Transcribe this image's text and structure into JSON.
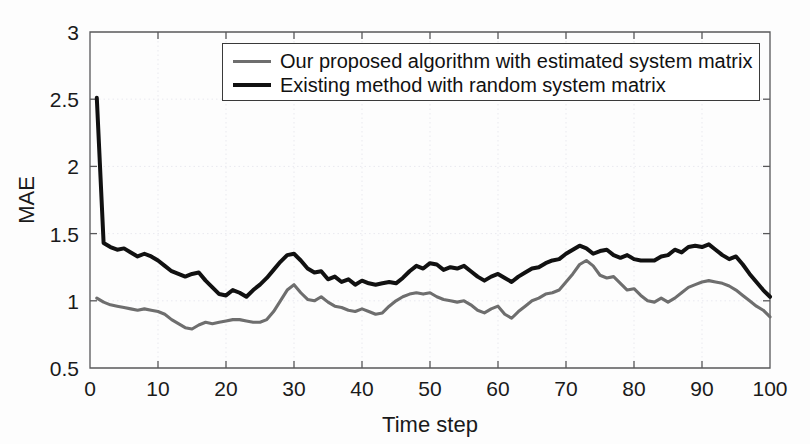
{
  "chart_data": {
    "type": "line",
    "title": "",
    "xlabel": "Time step",
    "ylabel": "MAE",
    "xlim": [
      0,
      100
    ],
    "ylim": [
      0.5,
      3
    ],
    "xticks": [
      0,
      10,
      20,
      30,
      40,
      50,
      60,
      70,
      80,
      90,
      100
    ],
    "xtick_labels": [
      "0",
      "10",
      "20",
      "30",
      "40",
      "50",
      "60",
      "70",
      "80",
      "90",
      "100"
    ],
    "yticks": [
      0.5,
      1,
      1.5,
      2,
      2.5,
      3
    ],
    "ytick_labels": [
      "0.5",
      "1",
      "1.5",
      "2",
      "2.5",
      "3"
    ],
    "grid": true,
    "legend_position": "top-center",
    "colors": {
      "proposed": "#6e6e6e",
      "existing": "#111111",
      "axis": "#58585a",
      "grid": "#e9e9ef",
      "background": "#ffffff"
    },
    "x": [
      1,
      2,
      3,
      4,
      5,
      6,
      7,
      8,
      9,
      10,
      11,
      12,
      13,
      14,
      15,
      16,
      17,
      18,
      19,
      20,
      21,
      22,
      23,
      24,
      25,
      26,
      27,
      28,
      29,
      30,
      31,
      32,
      33,
      34,
      35,
      36,
      37,
      38,
      39,
      40,
      41,
      42,
      43,
      44,
      45,
      46,
      47,
      48,
      49,
      50,
      51,
      52,
      53,
      54,
      55,
      56,
      57,
      58,
      59,
      60,
      61,
      62,
      63,
      64,
      65,
      66,
      67,
      68,
      69,
      70,
      71,
      72,
      73,
      74,
      75,
      76,
      77,
      78,
      79,
      80,
      81,
      82,
      83,
      84,
      85,
      86,
      87,
      88,
      89,
      90,
      91,
      92,
      93,
      94,
      95,
      96,
      97,
      98,
      99,
      100
    ],
    "series": [
      {
        "name": "Our proposed algorithm with estimated system matrix",
        "key": "proposed",
        "color": "#6e6e6e",
        "linewidth": 3.1,
        "values": [
          1.02,
          0.99,
          0.97,
          0.96,
          0.95,
          0.94,
          0.93,
          0.94,
          0.93,
          0.92,
          0.9,
          0.86,
          0.83,
          0.8,
          0.79,
          0.82,
          0.84,
          0.83,
          0.84,
          0.85,
          0.86,
          0.86,
          0.85,
          0.84,
          0.84,
          0.86,
          0.92,
          1.0,
          1.08,
          1.12,
          1.06,
          1.01,
          1.0,
          1.03,
          0.99,
          0.96,
          0.95,
          0.93,
          0.92,
          0.94,
          0.92,
          0.9,
          0.91,
          0.96,
          1.0,
          1.03,
          1.05,
          1.06,
          1.05,
          1.06,
          1.03,
          1.01,
          1.0,
          0.99,
          1.0,
          0.97,
          0.93,
          0.91,
          0.94,
          0.96,
          0.9,
          0.87,
          0.92,
          0.96,
          1.0,
          1.02,
          1.05,
          1.06,
          1.08,
          1.14,
          1.2,
          1.27,
          1.3,
          1.26,
          1.19,
          1.17,
          1.18,
          1.13,
          1.08,
          1.09,
          1.04,
          1.0,
          0.99,
          1.02,
          0.99,
          1.02,
          1.06,
          1.1,
          1.12,
          1.14,
          1.15,
          1.14,
          1.13,
          1.11,
          1.08,
          1.04,
          1.0,
          0.96,
          0.93,
          0.88
        ]
      },
      {
        "name": "Existing method with random system matrix",
        "key": "existing",
        "color": "#111111",
        "linewidth": 4.0,
        "values": [
          2.51,
          1.43,
          1.4,
          1.38,
          1.39,
          1.36,
          1.33,
          1.35,
          1.33,
          1.3,
          1.26,
          1.22,
          1.2,
          1.18,
          1.2,
          1.21,
          1.15,
          1.1,
          1.05,
          1.04,
          1.08,
          1.06,
          1.03,
          1.08,
          1.12,
          1.17,
          1.23,
          1.29,
          1.34,
          1.35,
          1.3,
          1.24,
          1.21,
          1.22,
          1.16,
          1.18,
          1.14,
          1.16,
          1.12,
          1.15,
          1.13,
          1.12,
          1.13,
          1.14,
          1.13,
          1.17,
          1.22,
          1.26,
          1.24,
          1.28,
          1.27,
          1.23,
          1.25,
          1.24,
          1.26,
          1.22,
          1.18,
          1.15,
          1.18,
          1.2,
          1.17,
          1.14,
          1.18,
          1.21,
          1.24,
          1.25,
          1.28,
          1.3,
          1.31,
          1.35,
          1.38,
          1.41,
          1.39,
          1.35,
          1.37,
          1.38,
          1.34,
          1.32,
          1.34,
          1.31,
          1.3,
          1.3,
          1.3,
          1.33,
          1.34,
          1.38,
          1.36,
          1.4,
          1.41,
          1.4,
          1.42,
          1.38,
          1.34,
          1.31,
          1.33,
          1.27,
          1.2,
          1.14,
          1.08,
          1.03
        ]
      }
    ]
  },
  "legend": {
    "items": [
      {
        "label": "Our proposed algorithm with estimated system matrix",
        "swatch": "proposed-line-swatch"
      },
      {
        "label": "Existing method with random system matrix",
        "swatch": "existing-line-swatch"
      }
    ]
  }
}
